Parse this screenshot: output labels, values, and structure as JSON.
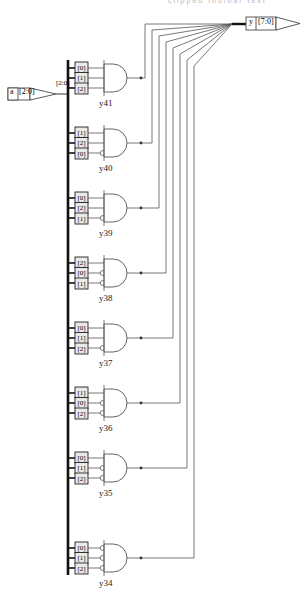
{
  "document": {
    "title": "Decoder schematic (RTL view)",
    "top_clipped_text": "clipped toolbar text"
  },
  "ports": {
    "input": {
      "name": "a",
      "range": "[2:0]",
      "bus_label": "[2:0]",
      "direction": "input"
    },
    "output": {
      "name": "y",
      "range": "[7:0]",
      "direction": "output"
    }
  },
  "gates": [
    {
      "name": "y41",
      "type": "AND",
      "inputs": [
        {
          "index": "[0]",
          "inverted": false
        },
        {
          "index": "[1]",
          "inverted": false
        },
        {
          "index": "[2]",
          "inverted": false
        }
      ]
    },
    {
      "name": "y40",
      "type": "AND",
      "inputs": [
        {
          "index": "[1]",
          "inverted": false
        },
        {
          "index": "[2]",
          "inverted": false
        },
        {
          "index": "[0]",
          "inverted": true
        }
      ]
    },
    {
      "name": "y39",
      "type": "AND",
      "inputs": [
        {
          "index": "[0]",
          "inverted": false
        },
        {
          "index": "[2]",
          "inverted": false
        },
        {
          "index": "[1]",
          "inverted": true
        }
      ]
    },
    {
      "name": "y38",
      "type": "AND",
      "inputs": [
        {
          "index": "[2]",
          "inverted": false
        },
        {
          "index": "[0]",
          "inverted": true
        },
        {
          "index": "[1]",
          "inverted": true
        }
      ]
    },
    {
      "name": "y37",
      "type": "AND",
      "inputs": [
        {
          "index": "[0]",
          "inverted": false
        },
        {
          "index": "[1]",
          "inverted": false
        },
        {
          "index": "[2]",
          "inverted": true
        }
      ]
    },
    {
      "name": "y36",
      "type": "AND",
      "inputs": [
        {
          "index": "[1]",
          "inverted": false
        },
        {
          "index": "[0]",
          "inverted": true
        },
        {
          "index": "[2]",
          "inverted": true
        }
      ]
    },
    {
      "name": "y35",
      "type": "AND",
      "inputs": [
        {
          "index": "[0]",
          "inverted": false
        },
        {
          "index": "[1]",
          "inverted": true
        },
        {
          "index": "[2]",
          "inverted": true
        }
      ]
    },
    {
      "name": "y34",
      "type": "AND",
      "inputs": [
        {
          "index": "[0]",
          "inverted": true
        },
        {
          "index": "[1]",
          "inverted": true
        },
        {
          "index": "[2]",
          "inverted": true
        }
      ]
    }
  ],
  "colors": {
    "wire": "#555555",
    "bus": "#111111",
    "outline": "#333333",
    "background": "#ffffff",
    "pinbox_fill": "#e9e9e9"
  }
}
